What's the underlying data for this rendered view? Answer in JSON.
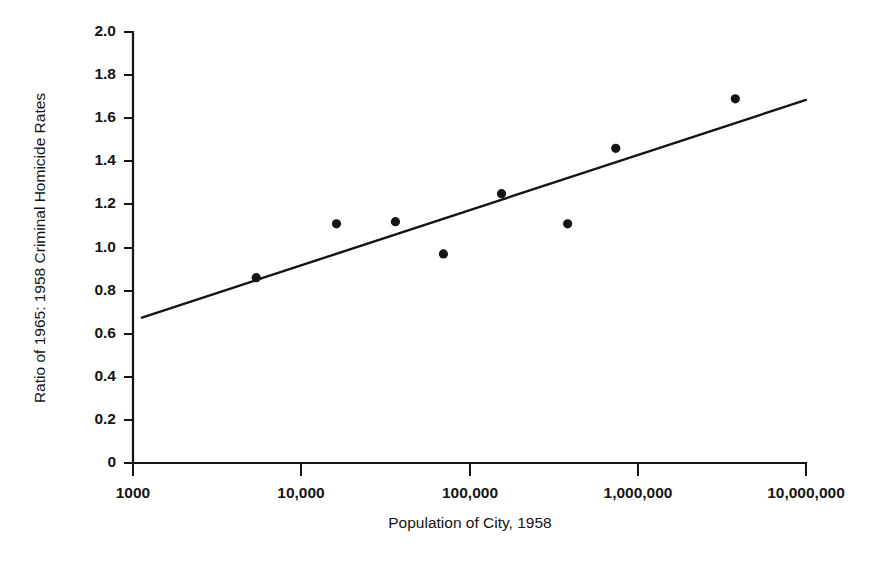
{
  "chart_data": {
    "type": "scatter",
    "title": "",
    "xlabel": "Population of City, 1958",
    "ylabel": "Ratio of 1965: 1958 Criminal Homicide Rates",
    "x_scale": "log",
    "y_scale": "linear",
    "xlim": [
      1000,
      10000000
    ],
    "ylim": [
      0,
      2.0
    ],
    "grid": false,
    "legend": "none",
    "x_ticks": [
      1000,
      10000,
      100000,
      1000000,
      10000000
    ],
    "x_tick_labels": [
      "1000",
      "10,000",
      "100,000",
      "1,000,000",
      "10,000,000"
    ],
    "y_ticks": [
      0,
      0.2,
      0.4,
      0.6,
      0.8,
      1.0,
      1.2,
      1.4,
      1.6,
      1.8,
      2.0
    ],
    "y_tick_labels": [
      "0",
      "0.2",
      "0.4",
      "0.6",
      "0.8",
      "1.0",
      "1.2",
      "1.4",
      "1.6",
      "1.8",
      "2.0"
    ],
    "series": [
      {
        "name": "City observations",
        "marker": "filled-circle",
        "color": "#141414",
        "points": [
          {
            "x": 5400,
            "y": 0.86
          },
          {
            "x": 16200,
            "y": 1.11
          },
          {
            "x": 36300,
            "y": 1.12
          },
          {
            "x": 70000,
            "y": 0.97
          },
          {
            "x": 155000,
            "y": 1.25
          },
          {
            "x": 383000,
            "y": 1.11
          },
          {
            "x": 740000,
            "y": 1.46
          },
          {
            "x": 3800000,
            "y": 1.69
          }
        ]
      },
      {
        "name": "Fitted regression line",
        "type": "line",
        "color": "#141414",
        "points": [
          {
            "x": 1130,
            "y": 0.675
          },
          {
            "x": 10000000,
            "y": 1.685
          }
        ]
      }
    ]
  },
  "figure": {
    "background_color": "#ffffff",
    "ink_color": "#141414"
  }
}
